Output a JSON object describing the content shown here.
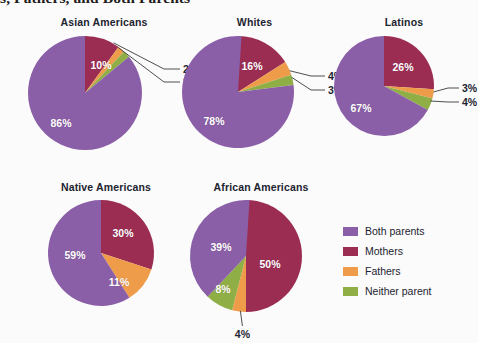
{
  "title": "s, Fathers, and Both Parents",
  "background_color": "#fbfbfb",
  "legend": {
    "position": "bottom-right",
    "items": [
      {
        "label": "Both parents",
        "color": "#8b5fa8"
      },
      {
        "label": "Mothers",
        "color": "#9b2d52"
      },
      {
        "label": "Fathers",
        "color": "#ee9c4a"
      },
      {
        "label": "Neither parent",
        "color": "#8fae45"
      }
    ]
  },
  "chart_data": {
    "type": "pie",
    "title": "s, Fathers, and Both Parents",
    "categories": [
      "Both parents",
      "Mothers",
      "Fathers",
      "Neither parent"
    ],
    "colors": [
      "#8b5fa8",
      "#9b2d52",
      "#ee9c4a",
      "#8fae45"
    ],
    "units": "percent",
    "start_angle_deg": 0,
    "direction": "clockwise",
    "slice_order": [
      "Mothers",
      "Fathers",
      "Neither parent",
      "Both parents"
    ],
    "charts": [
      {
        "name": "Asian Americans",
        "values": {
          "Both parents": 86,
          "Mothers": 10,
          "Fathers": 2,
          "Neither parent": 2
        },
        "labels": [
          {
            "category": "Both parents",
            "text": "86%",
            "placement": "inside"
          },
          {
            "category": "Mothers",
            "text": "10%",
            "placement": "inside"
          },
          {
            "category": "Fathers",
            "text": "2%",
            "placement": "callout"
          },
          {
            "category": "Neither parent",
            "text": "2%",
            "placement": "callout"
          }
        ]
      },
      {
        "name": "Whites",
        "values": {
          "Both parents": 78,
          "Mothers": 16,
          "Fathers": 4,
          "Neither parent": 3
        },
        "labels": [
          {
            "category": "Both parents",
            "text": "78%",
            "placement": "inside"
          },
          {
            "category": "Mothers",
            "text": "16%",
            "placement": "inside"
          },
          {
            "category": "Fathers",
            "text": "4%",
            "placement": "callout"
          },
          {
            "category": "Neither parent",
            "text": "3%",
            "placement": "callout"
          }
        ]
      },
      {
        "name": "Latinos",
        "values": {
          "Both parents": 67,
          "Mothers": 26,
          "Fathers": 3,
          "Neither parent": 4
        },
        "labels": [
          {
            "category": "Both parents",
            "text": "67%",
            "placement": "inside"
          },
          {
            "category": "Mothers",
            "text": "26%",
            "placement": "inside"
          },
          {
            "category": "Fathers",
            "text": "3%",
            "placement": "callout"
          },
          {
            "category": "Neither parent",
            "text": "4%",
            "placement": "callout"
          }
        ]
      },
      {
        "name": "Native Americans",
        "values": {
          "Both parents": 59,
          "Mothers": 30,
          "Fathers": 11,
          "Neither parent": 0
        },
        "labels": [
          {
            "category": "Both parents",
            "text": "59%",
            "placement": "inside"
          },
          {
            "category": "Mothers",
            "text": "30%",
            "placement": "inside"
          },
          {
            "category": "Fathers",
            "text": "11%",
            "placement": "inside"
          }
        ]
      },
      {
        "name": "African Americans",
        "values": {
          "Both parents": 39,
          "Mothers": 50,
          "Fathers": 4,
          "Neither parent": 8
        },
        "labels": [
          {
            "category": "Both parents",
            "text": "39%",
            "placement": "inside"
          },
          {
            "category": "Mothers",
            "text": "50%",
            "placement": "inside"
          },
          {
            "category": "Fathers",
            "text": "4%",
            "placement": "callout"
          },
          {
            "category": "Neither parent",
            "text": "8%",
            "placement": "inside"
          }
        ]
      }
    ]
  }
}
